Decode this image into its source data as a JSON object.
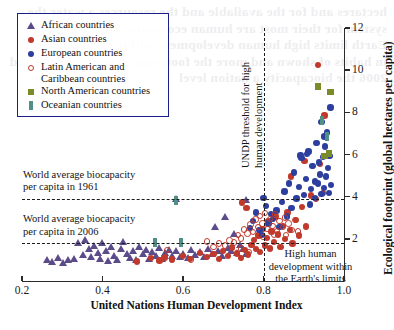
{
  "chart_data": {
    "type": "scatter",
    "title": "",
    "xlabel": "United Nations Human Development Index",
    "ylabel": "Ecological footprint (global hectares per capita)",
    "xlim": [
      0.2,
      1.0
    ],
    "ylim": [
      0,
      12
    ],
    "xticks": [
      "0.2",
      "0.4",
      "0.6",
      "0.8",
      "1.0"
    ],
    "xtick_values": [
      0.2,
      0.4,
      0.6,
      0.8,
      1.0
    ],
    "yticks": [
      "2",
      "4",
      "6",
      "8",
      "10",
      "12"
    ],
    "ytick_values": [
      2,
      4,
      6,
      8,
      10,
      12
    ],
    "yaxis_position": "right",
    "grid": false,
    "legend_position": "top-left",
    "reference_lines": [
      {
        "name": "world-biocapacity-1961",
        "orientation": "horizontal",
        "value": 3.9,
        "style": "dashed",
        "label": "World average biocapacity\nper capita in 1961"
      },
      {
        "name": "world-biocapacity-2006",
        "orientation": "horizontal",
        "value": 1.78,
        "style": "dashed",
        "label": "World average biocapacity\nper capita in 2006"
      },
      {
        "name": "undp-threshold",
        "orientation": "vertical",
        "value": 0.8,
        "style": "dashed",
        "label": "UNDP threshold for high\nhuman development"
      }
    ],
    "annotations": [
      {
        "name": "high-human-development-zone",
        "text": "High human\ndevelopment within\nthe Earth's limits",
        "x": 0.895,
        "y": 1.1
      }
    ],
    "series": [
      {
        "name": "African countries",
        "marker": "triangle",
        "color": "#5b4b8a",
        "points": [
          [
            0.315,
            1.0
          ],
          [
            0.33,
            1.05
          ],
          [
            0.34,
            1.82
          ],
          [
            0.352,
            1.25
          ],
          [
            0.358,
            1.95
          ],
          [
            0.366,
            1.55
          ],
          [
            0.372,
            1.15
          ],
          [
            0.38,
            1.7
          ],
          [
            0.388,
            1.35
          ],
          [
            0.394,
            1.05
          ],
          [
            0.4,
            1.8
          ],
          [
            0.408,
            1.45
          ],
          [
            0.414,
            0.95
          ],
          [
            0.422,
            1.62
          ],
          [
            0.43,
            1.2
          ],
          [
            0.437,
            1.0
          ],
          [
            0.445,
            1.55
          ],
          [
            0.452,
            1.85
          ],
          [
            0.46,
            1.3
          ],
          [
            0.468,
            1.1
          ],
          [
            0.476,
            1.45
          ],
          [
            0.484,
            1.0
          ],
          [
            0.492,
            1.62
          ],
          [
            0.5,
            1.28
          ],
          [
            0.508,
            1.5
          ],
          [
            0.516,
            1.08
          ],
          [
            0.524,
            1.4
          ],
          [
            0.532,
            1.2
          ],
          [
            0.54,
            1.58
          ],
          [
            0.548,
            1.05
          ],
          [
            0.556,
            1.35
          ],
          [
            0.566,
            1.5
          ],
          [
            0.574,
            1.22
          ],
          [
            0.584,
            1.42
          ],
          [
            0.592,
            1.18
          ],
          [
            0.6,
            1.32
          ],
          [
            0.612,
            1.1
          ],
          [
            0.62,
            1.48
          ],
          [
            0.63,
            1.25
          ],
          [
            0.642,
            1.38
          ],
          [
            0.652,
            1.15
          ],
          [
            0.662,
            1.55
          ],
          [
            0.672,
            1.3
          ],
          [
            0.68,
            2.6
          ],
          [
            0.688,
            1.42
          ],
          [
            0.696,
            1.2
          ],
          [
            0.704,
            3.05
          ],
          [
            0.712,
            1.6
          ],
          [
            0.72,
            1.45
          ],
          [
            0.726,
            2.25
          ],
          [
            0.734,
            1.35
          ],
          [
            0.742,
            1.75
          ],
          [
            0.75,
            1.55
          ],
          [
            0.758,
            1.3
          ],
          [
            0.262,
            1.02
          ],
          [
            0.276,
            0.92
          ],
          [
            0.29,
            1.12
          ],
          [
            0.302,
            0.88
          ],
          [
            0.582,
            3.9
          ],
          [
            0.756,
            3.85
          ]
        ]
      },
      {
        "name": "Asian countries",
        "marker": "circle",
        "color": "#c0392b",
        "points": [
          [
            0.485,
            0.92
          ],
          [
            0.52,
            1.08
          ],
          [
            0.542,
            0.98
          ],
          [
            0.556,
            1.12
          ],
          [
            0.572,
            1.02
          ],
          [
            0.6,
            1.2
          ],
          [
            0.618,
            1.05
          ],
          [
            0.642,
            1.32
          ],
          [
            0.66,
            1.15
          ],
          [
            0.676,
            1.28
          ],
          [
            0.69,
            1.05
          ],
          [
            0.7,
            1.42
          ],
          [
            0.712,
            1.18
          ],
          [
            0.722,
            1.58
          ],
          [
            0.734,
            1.3
          ],
          [
            0.744,
            1.1
          ],
          [
            0.754,
            1.48
          ],
          [
            0.762,
            1.25
          ],
          [
            0.77,
            1.72
          ],
          [
            0.776,
            1.95
          ],
          [
            0.782,
            1.52
          ],
          [
            0.788,
            2.15
          ],
          [
            0.792,
            1.38
          ],
          [
            0.798,
            2.48
          ],
          [
            0.803,
            1.68
          ],
          [
            0.808,
            2.05
          ],
          [
            0.812,
            2.85
          ],
          [
            0.816,
            1.55
          ],
          [
            0.82,
            2.35
          ],
          [
            0.826,
            1.85
          ],
          [
            0.83,
            3.05
          ],
          [
            0.836,
            2.2
          ],
          [
            0.842,
            1.62
          ],
          [
            0.848,
            2.62
          ],
          [
            0.854,
            2.0
          ],
          [
            0.86,
            3.25
          ],
          [
            0.866,
            2.42
          ],
          [
            0.872,
            1.78
          ],
          [
            0.88,
            2.88
          ],
          [
            0.888,
            2.15
          ],
          [
            0.896,
            3.52
          ],
          [
            0.906,
            2.58
          ],
          [
            0.918,
            4.05
          ],
          [
            0.93,
            3.88
          ],
          [
            0.94,
            5.55
          ],
          [
            0.948,
            4.18
          ],
          [
            0.952,
            7.85
          ],
          [
            0.935,
            10.25
          ],
          [
            0.746,
            3.72
          ],
          [
            0.758,
            3.45
          ],
          [
            0.902,
            5.68
          ],
          [
            0.868,
            4.95
          ]
        ]
      },
      {
        "name": "European countries",
        "marker": "circle",
        "color": "#2c3e9e",
        "points": [
          [
            0.8,
            3.95
          ],
          [
            0.806,
            3.55
          ],
          [
            0.812,
            2.72
          ],
          [
            0.818,
            3.18
          ],
          [
            0.824,
            2.95
          ],
          [
            0.832,
            3.35
          ],
          [
            0.84,
            2.55
          ],
          [
            0.846,
            3.75
          ],
          [
            0.852,
            4.25
          ],
          [
            0.858,
            3.05
          ],
          [
            0.864,
            4.62
          ],
          [
            0.87,
            3.45
          ],
          [
            0.876,
            5.15
          ],
          [
            0.882,
            3.92
          ],
          [
            0.888,
            4.45
          ],
          [
            0.894,
            5.82
          ],
          [
            0.9,
            4.08
          ],
          [
            0.906,
            4.85
          ],
          [
            0.912,
            6.15
          ],
          [
            0.918,
            4.35
          ],
          [
            0.922,
            5.45
          ],
          [
            0.928,
            3.95
          ],
          [
            0.932,
            6.55
          ],
          [
            0.936,
            4.62
          ],
          [
            0.94,
            5.05
          ],
          [
            0.944,
            4.12
          ],
          [
            0.948,
            5.88
          ],
          [
            0.95,
            4.42
          ],
          [
            0.953,
            6.38
          ],
          [
            0.956,
            4.95
          ],
          [
            0.958,
            7.05
          ],
          [
            0.96,
            5.35
          ],
          [
            0.962,
            4.18
          ],
          [
            0.964,
            5.92
          ],
          [
            0.966,
            8.22
          ],
          [
            0.968,
            4.55
          ],
          [
            0.944,
            7.55
          ],
          [
            0.95,
            6.85
          ],
          [
            0.938,
            5.62
          ],
          [
            0.928,
            4.72
          ],
          [
            0.916,
            3.62
          ],
          [
            0.908,
            6.02
          ],
          [
            0.79,
            2.42
          ],
          [
            0.782,
            3.25
          ],
          [
            0.796,
            2.18
          ],
          [
            0.774,
            2.85
          ],
          [
            0.766,
            2.52
          ],
          [
            0.892,
            5.95
          ]
        ]
      },
      {
        "name": "Latin American and Caribbean countries",
        "marker": "open-circle",
        "color": "#c0392b",
        "points": [
          [
            0.69,
            1.78
          ],
          [
            0.705,
            1.68
          ],
          [
            0.716,
            1.92
          ],
          [
            0.726,
            1.82
          ],
          [
            0.736,
            2.18
          ],
          [
            0.744,
            2.02
          ],
          [
            0.752,
            2.45
          ],
          [
            0.76,
            2.25
          ],
          [
            0.768,
            2.68
          ],
          [
            0.774,
            2.32
          ],
          [
            0.78,
            2.92
          ],
          [
            0.786,
            2.55
          ],
          [
            0.792,
            3.08
          ],
          [
            0.798,
            2.72
          ],
          [
            0.804,
            3.22
          ],
          [
            0.81,
            2.48
          ],
          [
            0.816,
            2.95
          ],
          [
            0.822,
            2.62
          ],
          [
            0.828,
            3.15
          ],
          [
            0.834,
            2.38
          ],
          [
            0.84,
            2.85
          ],
          [
            0.848,
            2.55
          ],
          [
            0.854,
            3.02
          ],
          [
            0.862,
            2.72
          ],
          [
            0.87,
            2.42
          ],
          [
            0.878,
            2.9
          ],
          [
            0.886,
            2.35
          ],
          [
            0.62,
            1.02
          ],
          [
            0.56,
            1.48
          ],
          [
            0.66,
            1.88
          ],
          [
            0.676,
            1.62
          ],
          [
            0.744,
            1.55
          ],
          [
            0.764,
            1.38
          ],
          [
            0.8,
            2.08
          ],
          [
            0.826,
            2.2
          ],
          [
            0.856,
            2.18
          ]
        ]
      },
      {
        "name": "North American countries",
        "marker": "square",
        "color": "#7a8c2a",
        "points": [
          [
            0.935,
            9.22
          ],
          [
            0.966,
            8.95
          ],
          [
            0.962,
            6.05
          ],
          [
            0.952,
            5.92
          ]
        ]
      },
      {
        "name": "Oceanian countries",
        "marker": "vertical-rect",
        "color": "#4f8f86",
        "points": [
          [
            0.53,
            1.82
          ],
          [
            0.595,
            1.82
          ],
          [
            0.582,
            3.82
          ],
          [
            0.946,
            7.62
          ],
          [
            0.958,
            6.85
          ]
        ]
      }
    ]
  },
  "legend": {
    "items": [
      {
        "label": "African countries",
        "marker": "triangle",
        "color": "#5b4b8a"
      },
      {
        "label": "Asian countries",
        "marker": "circle",
        "color": "#c0392b"
      },
      {
        "label": "European countries",
        "marker": "circle",
        "color": "#2c3e9e"
      },
      {
        "label": "Latin American and\nCaribbean countries",
        "marker": "open-circle",
        "color": "#c0392b"
      },
      {
        "label": "North American countries",
        "marker": "square",
        "color": "#7a8c2a"
      },
      {
        "label": "Oceanian countries",
        "marker": "vertical-rect",
        "color": "#4f8f86"
      }
    ],
    "border_color": "#1b1f8a"
  },
  "labels": {
    "biocapacity_1961": "World average biocapacity\nper capita in 1961",
    "biocapacity_2006": "World average biocapacity\nper capita in 2006",
    "undp_threshold": "UNDP threshold for high\nhuman development",
    "high_human_dev": "High human\ndevelopment within\nthe Earth's limits",
    "x_axis_title": "United Nations Human Development Index",
    "y_axis_title": "Ecological footprint (global hectares per capita)"
  },
  "background_text": "hectares and for the available and the resources a water the system for their most are human economies for the demand Earth limits high human development within the global both in habits of shown and more the footprint a country of the and 2006 the biocapacity a nation level"
}
